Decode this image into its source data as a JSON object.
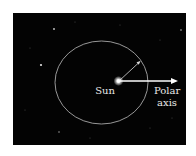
{
  "diagram": {
    "labels": {
      "sun": "Sun",
      "polar_line1": "Polar",
      "polar_line2": "axis"
    },
    "colors": {
      "background": "#030303",
      "orbit": "#bdbdbd",
      "arrow": "#ffffff",
      "text": "#e8e8e8"
    },
    "elements": [
      "starfield",
      "elliptical-orbit",
      "sun",
      "radius-vector",
      "polar-axis-arrow"
    ]
  }
}
